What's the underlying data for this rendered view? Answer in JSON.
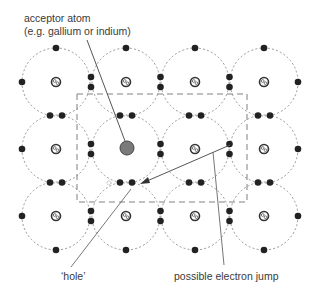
{
  "labels": {
    "acceptor_line1": "acceptor atom",
    "acceptor_line2": "(e.g. gallium or indium)",
    "hole": "‘hole’",
    "electron_jump": "possible electron jump"
  },
  "lattice": {
    "columns_x": [
      56,
      126,
      195,
      264
    ],
    "rows_y": [
      82,
      149,
      216
    ],
    "orbit_radius": 34,
    "acceptor_position": {
      "col": 1,
      "row": 1
    },
    "hole_position": {
      "x": 109,
      "y": 183
    }
  },
  "colors": {
    "electron": "#222222",
    "orbit": "#8a8a8a",
    "acceptor": "#7a7a7a",
    "box": "#808080",
    "line": "#555555"
  }
}
